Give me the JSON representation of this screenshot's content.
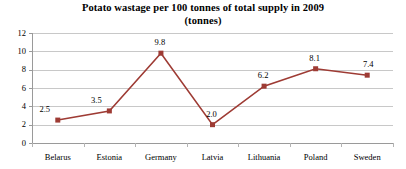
{
  "chart_data": {
    "type": "line",
    "title": "Potato wastage per 100 tonnes of total supply in 2009",
    "subtitle": "(tonnes)",
    "xlabel": "",
    "ylabel": "",
    "categories": [
      "Belarus",
      "Estonia",
      "Germany",
      "Latvia",
      "Lithuania",
      "Poland",
      "Sweden"
    ],
    "values": [
      2.5,
      3.5,
      9.8,
      2.0,
      6.2,
      8.1,
      7.4
    ],
    "data_labels": [
      "2.5",
      "3.5",
      "9.8",
      "2.0",
      "6.2",
      "8.1",
      "7.4"
    ],
    "ylim": [
      0,
      12
    ],
    "ytick_labels": [
      "12",
      "10",
      "8",
      "6",
      "4",
      "2",
      "0"
    ],
    "ytick_values": [
      12,
      10,
      8,
      6,
      4,
      2,
      0
    ],
    "grid": true,
    "legend": false,
    "series_color": "#9E3B34",
    "gridline_color": "#C8C8C8",
    "axis_color": "#9A9A9A",
    "background_color": "#FFFFFF",
    "marker": "square"
  }
}
